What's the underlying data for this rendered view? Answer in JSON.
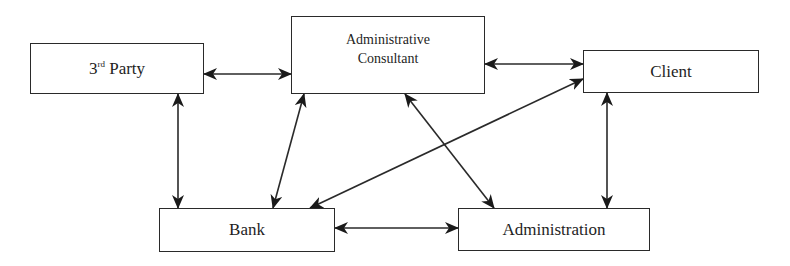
{
  "diagram": {
    "type": "flow",
    "nodes": {
      "third_party": {
        "label_main": "3",
        "label_sup": "rd",
        "label_rest": " Party"
      },
      "admin_consultant": {
        "line1": "Administrative",
        "line2": "Consultant"
      },
      "client": {
        "label": "Client"
      },
      "bank": {
        "label": "Bank"
      },
      "administration": {
        "label": "Administration"
      }
    },
    "edges": [
      {
        "from": "3rd Party",
        "to": "Administrative Consultant",
        "direction": "bidirectional"
      },
      {
        "from": "Administrative Consultant",
        "to": "Client",
        "direction": "bidirectional"
      },
      {
        "from": "3rd Party",
        "to": "Bank",
        "direction": "bidirectional"
      },
      {
        "from": "Administrative Consultant",
        "to": "Bank",
        "direction": "bidirectional"
      },
      {
        "from": "Administrative Consultant",
        "to": "Administration",
        "direction": "bidirectional"
      },
      {
        "from": "Client",
        "to": "Bank",
        "direction": "bidirectional"
      },
      {
        "from": "Client",
        "to": "Administration",
        "direction": "bidirectional"
      },
      {
        "from": "Bank",
        "to": "Administration",
        "direction": "bidirectional"
      }
    ],
    "colors": {
      "stroke": "#2a2a2a",
      "text": "#1e1e1e",
      "background": "#ffffff"
    }
  }
}
